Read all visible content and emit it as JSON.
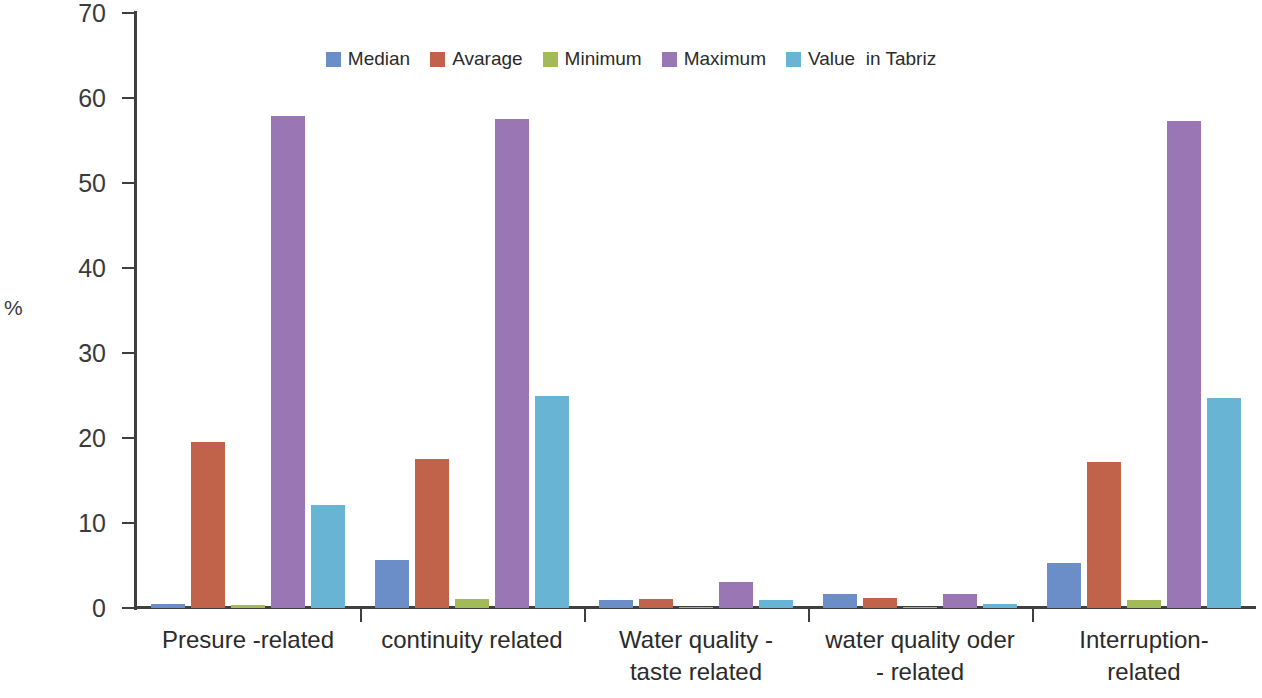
{
  "chart_data": {
    "type": "bar",
    "title": "",
    "subtitle": "",
    "xlabel": "",
    "ylabel": "%",
    "ylim": [
      0,
      70
    ],
    "ytick_step": 10,
    "yticks": [
      70,
      60,
      50,
      40,
      30,
      20,
      10,
      0
    ],
    "grid": false,
    "legend_position": "top-center",
    "categories": [
      "Presure -related",
      "continuity related",
      "Water quality -\ntaste related",
      "water quality oder\n- related",
      "Interruption-\nrelated"
    ],
    "series": [
      {
        "name": "Median",
        "color": "#6b8ec9",
        "values": [
          0.5,
          5.6,
          0.9,
          1.7,
          5.3
        ]
      },
      {
        "name": "Avarage",
        "color": "#c0634a",
        "values": [
          19.5,
          17.5,
          1.1,
          1.2,
          17.2
        ]
      },
      {
        "name": "Minimum",
        "color": "#a2ba57",
        "values": [
          0.3,
          1.1,
          0.05,
          0.15,
          1.0
        ]
      },
      {
        "name": "Maximum",
        "color": "#9a76b4",
        "values": [
          57.9,
          57.5,
          3.1,
          1.7,
          57.3
        ]
      },
      {
        "name": "Value  in Tabriz",
        "color": "#68b4d4",
        "values": [
          12.1,
          25.0,
          0.9,
          0.5,
          24.7
        ]
      }
    ]
  },
  "legend": {
    "items": [
      {
        "label": "Median"
      },
      {
        "label": "Avarage"
      },
      {
        "label": "Minimum"
      },
      {
        "label": "Maximum"
      },
      {
        "label": "Value  in Tabriz"
      }
    ]
  },
  "axis": {
    "y_title": "%",
    "y_tick_labels": [
      "70",
      "60",
      "50",
      "40",
      "30",
      "20",
      "10",
      "0"
    ]
  }
}
